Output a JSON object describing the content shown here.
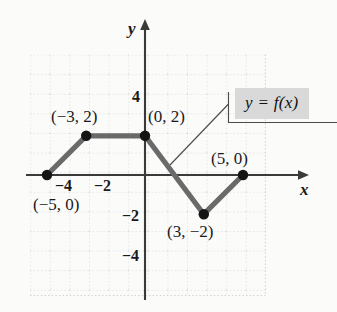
{
  "figure": {
    "type": "piecewise-linear-graph",
    "function_label": "y = f(x)",
    "axis_x_name": "x",
    "axis_y_name": "y",
    "background_color": "#fbfbfa",
    "curve_color": "#6a6a6a",
    "point_color": "#1a1a1a",
    "grid_color": "#cfcfcf",
    "axis_color": "#3a3a3a",
    "label_box_color": "#d9d9d9"
  },
  "chart_data": {
    "type": "line",
    "title": "",
    "xlabel": "x",
    "ylabel": "y",
    "xlim": [
      -6,
      6
    ],
    "ylim": [
      -6,
      6
    ],
    "grid": true,
    "legend": "y = f(x)",
    "series": [
      {
        "name": "f(x)",
        "x": [
          -5,
          -3,
          0,
          3,
          5
        ],
        "y": [
          0,
          2,
          2,
          -2,
          0
        ]
      }
    ],
    "points": [
      {
        "x": -5,
        "y": 0,
        "label": "(−5, 0)"
      },
      {
        "x": -3,
        "y": 2,
        "label": "(−3, 2)"
      },
      {
        "x": 0,
        "y": 2,
        "label": "(0, 2)"
      },
      {
        "x": 3,
        "y": -2,
        "label": "(3, −2)"
      },
      {
        "x": 5,
        "y": 0,
        "label": "(5, 0)"
      }
    ],
    "xticks": [
      -4,
      -2
    ],
    "xticklabels": [
      "−4",
      "−2"
    ],
    "yticks": [
      4,
      -2,
      -4
    ],
    "yticklabels": [
      "4",
      "−2",
      "−4"
    ]
  },
  "labels": {
    "tick_x_neg4": "−4",
    "tick_x_neg2": "−2",
    "tick_y_4": "4",
    "tick_y_neg2": "−2",
    "tick_y_neg4": "−4",
    "point_neg3_2": "(−3, 2)",
    "point_0_2": "(0, 2)",
    "point_neg5_0": "(−5, 0)",
    "point_5_0": "(5, 0)",
    "point_3_neg2": "(3, −2)",
    "function_label": "y = f(x)",
    "axis_x": "x",
    "axis_y": "y"
  }
}
